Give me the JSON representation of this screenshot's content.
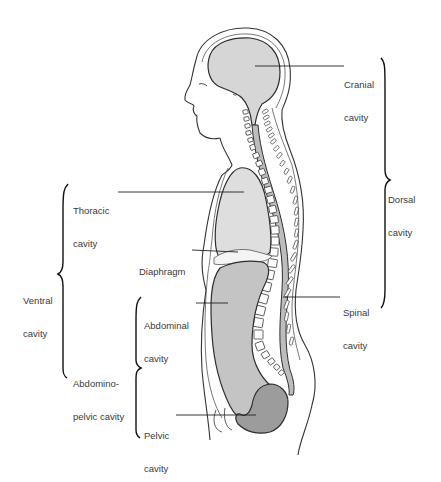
{
  "diagram": {
    "type": "anatomical-illustration",
    "colors": {
      "background": "#ffffff",
      "outline": "#333333",
      "cranial_fill": "#d6d6d6",
      "thoracic_fill": "#dedede",
      "abdominal_fill": "#c4c4c4",
      "pelvic_fill": "#9c9c9c",
      "spinal_fill": "#bdbdbd",
      "label_text": "#3a3a3a"
    },
    "labels": {
      "cranial": {
        "line1": "Cranial",
        "line2": "cavity"
      },
      "dorsal": {
        "line1": "Dorsal",
        "line2": "cavity"
      },
      "thoracic": {
        "line1": "Thoracic",
        "line2": "cavity"
      },
      "diaphragm": {
        "line1": "Diaphragm"
      },
      "ventral": {
        "line1": "Ventral",
        "line2": "cavity"
      },
      "spinal": {
        "line1": "Spinal",
        "line2": "cavity"
      },
      "abdominal": {
        "line1": "Abdominal",
        "line2": "cavity"
      },
      "abdominopelvic": {
        "line1": "Abdomino-",
        "line2": "pelvic cavity"
      },
      "pelvic": {
        "line1": "Pelvic",
        "line2": "cavity"
      }
    },
    "groupings": [
      {
        "bracket": "dorsal",
        "contains": [
          "cranial",
          "spinal"
        ]
      },
      {
        "bracket": "ventral",
        "contains": [
          "thoracic",
          "abdominopelvic"
        ]
      },
      {
        "bracket": "abdominopelvic",
        "contains": [
          "abdominal",
          "pelvic"
        ]
      }
    ]
  }
}
